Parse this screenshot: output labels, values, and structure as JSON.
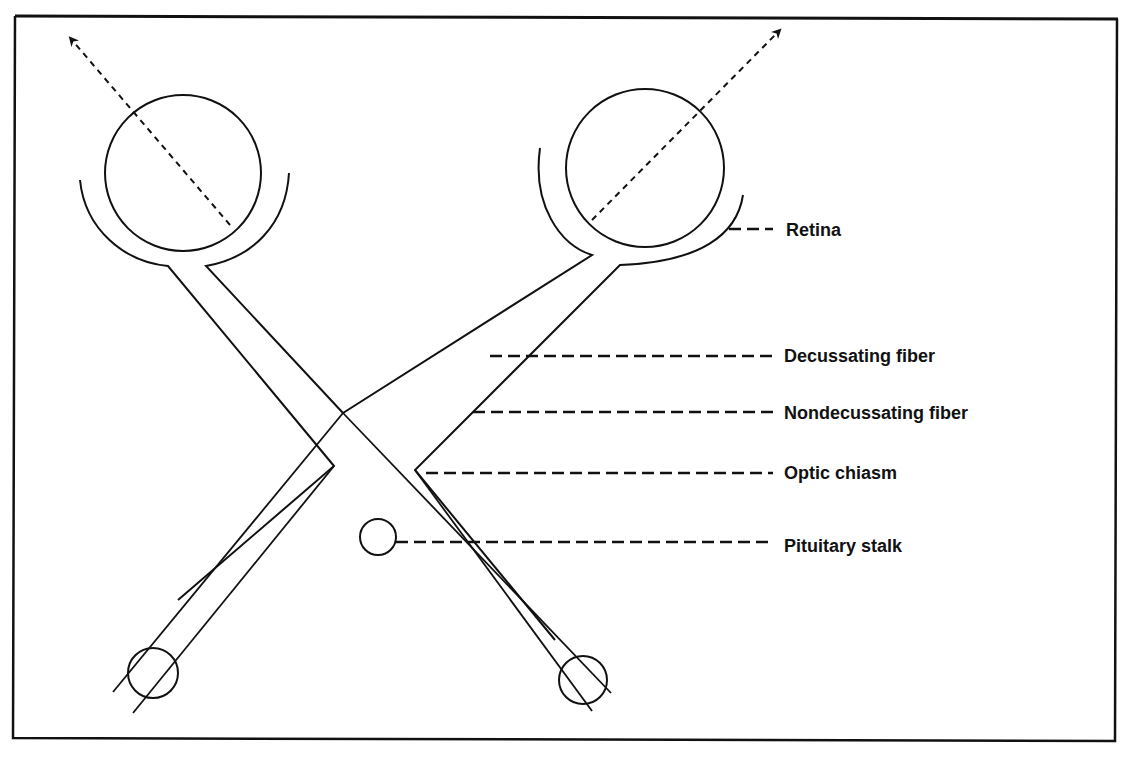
{
  "figure": {
    "labels": [
      {
        "id": "retina",
        "text": "Retina"
      },
      {
        "id": "decussating",
        "text": "Decussating fiber"
      },
      {
        "id": "nondecussating",
        "text": "Nondecussating fiber"
      },
      {
        "id": "chiasm",
        "text": "Optic chiasm"
      },
      {
        "id": "pituitary",
        "text": "Pituitary stalk"
      }
    ],
    "colors": {
      "line": "#111111",
      "background": "#ffffff"
    }
  }
}
